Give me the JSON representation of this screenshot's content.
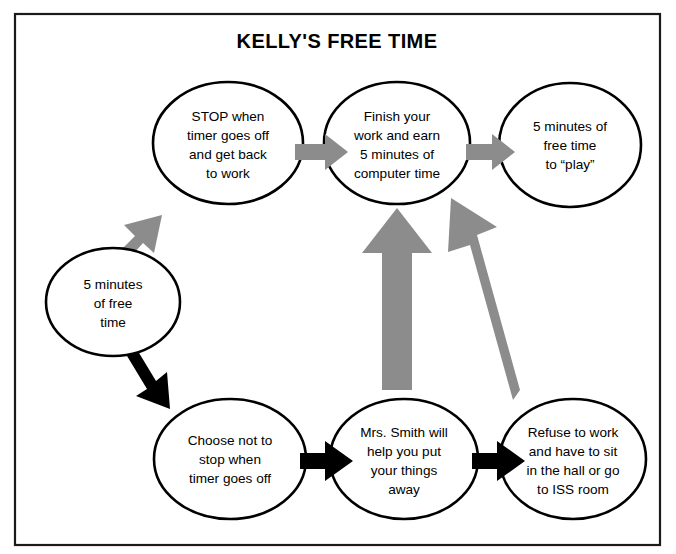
{
  "diagram": {
    "title": "KELLY'S FREE TIME",
    "type": "flowchart",
    "frame": {
      "border_color": "#1a1a1a"
    },
    "colors": {
      "positive_path_arrow": "#8c8c8c",
      "negative_path_arrow": "#000000",
      "node_outline": "#000000",
      "node_fill": "#ffffff",
      "text": "#000000"
    },
    "nodes": [
      {
        "id": "start",
        "label": "5 minutes of free time",
        "lines": [
          "5 minutes",
          "of free",
          "time"
        ],
        "row": "left"
      },
      {
        "id": "stop-when-timer",
        "label": "STOP when timer goes off and get back to work",
        "lines": [
          "STOP when",
          "timer goes off",
          "and get back",
          "to work"
        ],
        "row": "top"
      },
      {
        "id": "finish-work",
        "label": "Finish your work and earn 5 minutes of computer time",
        "lines": [
          "Finish your",
          "work and earn",
          "5 minutes of",
          "computer time"
        ],
        "row": "top"
      },
      {
        "id": "free-time-play",
        "label": "5 minutes of free time to “play”",
        "lines": [
          "5 minutes of",
          "free time",
          "to “play”"
        ],
        "row": "top"
      },
      {
        "id": "choose-not-to-stop",
        "label": "Choose not to stop when timer goes off",
        "lines": [
          "Choose not to",
          "stop when",
          "timer goes off"
        ],
        "row": "bottom"
      },
      {
        "id": "mrs-smith-helps",
        "label": "Mrs. Smith will help you put your things away",
        "lines": [
          "Mrs. Smith will",
          "help you put",
          "your things",
          "away"
        ],
        "row": "bottom"
      },
      {
        "id": "refuse-to-work",
        "label": "Refuse to work and have to sit in the hall or go to ISS room",
        "lines": [
          "Refuse to work",
          "and have to sit",
          "in the hall or go",
          "to ISS room"
        ],
        "row": "bottom"
      }
    ],
    "arrows": [
      {
        "id": "start-to-stop",
        "from": "start",
        "to": "stop-when-timer",
        "color": "gray",
        "direction": "up-right"
      },
      {
        "id": "stop-to-finish",
        "from": "stop-when-timer",
        "to": "finish-work",
        "color": "gray",
        "direction": "right"
      },
      {
        "id": "finish-to-play",
        "from": "finish-work",
        "to": "free-time-play",
        "color": "gray",
        "direction": "right"
      },
      {
        "id": "start-to-choose",
        "from": "start",
        "to": "choose-not-to-stop",
        "color": "black",
        "direction": "down-right"
      },
      {
        "id": "choose-to-smith",
        "from": "choose-not-to-stop",
        "to": "mrs-smith-helps",
        "color": "black",
        "direction": "right"
      },
      {
        "id": "smith-to-refuse",
        "from": "mrs-smith-helps",
        "to": "refuse-to-work",
        "color": "black",
        "direction": "right"
      },
      {
        "id": "smith-to-finish",
        "from": "mrs-smith-helps",
        "to": "finish-work",
        "color": "gray",
        "direction": "up"
      },
      {
        "id": "refuse-to-finish",
        "from": "refuse-to-work",
        "to": "finish-work",
        "color": "gray",
        "direction": "up-left"
      }
    ]
  }
}
